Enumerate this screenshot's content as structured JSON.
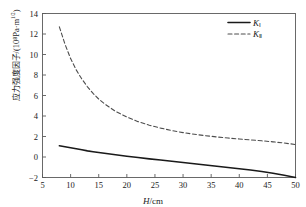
{
  "chart_data": {
    "type": "line",
    "title": "",
    "xlabel": "H/cm",
    "xlabel_italic": "H",
    "xlabel_rest": "/cm",
    "ylabel_cn": "应力强度因子",
    "ylabel_unit": "/(10⁸Pa·m",
    "ylabel_unit_sup": "1/2",
    "ylabel_unit_tail": ")",
    "ylabel_full": "应力强度因子/(10⁸Pa·m^(1/2))",
    "xlim": [
      5,
      50
    ],
    "ylim": [
      -2,
      14
    ],
    "xticks": [
      5,
      10,
      15,
      20,
      25,
      30,
      35,
      40,
      45,
      50
    ],
    "yticks": [
      -2,
      0,
      2,
      4,
      6,
      8,
      10,
      12,
      14
    ],
    "grid": false,
    "legend_position": "top-right",
    "x": [
      8,
      9,
      10,
      11,
      12,
      13,
      14,
      15,
      16,
      18,
      20,
      22,
      24,
      26,
      28,
      30,
      32,
      34,
      36,
      38,
      40,
      42,
      44,
      46,
      48,
      50
    ],
    "series": [
      {
        "name": "K_I",
        "label": "K",
        "sub": "Ⅰ",
        "style": "solid",
        "color": "#1a1a1a",
        "width": 1.6,
        "values": [
          1.1,
          1.0,
          0.9,
          0.8,
          0.7,
          0.6,
          0.52,
          0.44,
          0.36,
          0.22,
          0.08,
          -0.05,
          -0.18,
          -0.3,
          -0.42,
          -0.54,
          -0.66,
          -0.78,
          -0.9,
          -1.02,
          -1.14,
          -1.27,
          -1.42,
          -1.58,
          -1.78,
          -2.0
        ]
      },
      {
        "name": "K_II",
        "label": "K",
        "sub": "Ⅱ",
        "style": "dashed",
        "color": "#4d4d4d",
        "width": 1.1,
        "values": [
          12.7,
          11.0,
          9.6,
          8.5,
          7.6,
          6.85,
          6.2,
          5.65,
          5.2,
          4.45,
          3.9,
          3.45,
          3.1,
          2.82,
          2.58,
          2.38,
          2.22,
          2.08,
          1.96,
          1.85,
          1.76,
          1.67,
          1.58,
          1.48,
          1.36,
          1.22
        ]
      }
    ]
  },
  "axes": {
    "frame_color": "#5a5a5a",
    "tick_color": "#5a5a5a",
    "text_color": "#1a1a1a"
  }
}
